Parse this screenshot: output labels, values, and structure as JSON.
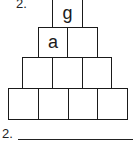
{
  "problem_number_top": "2.",
  "pyramid": {
    "rows": [
      [
        "g"
      ],
      [
        "a",
        ""
      ],
      [
        "",
        "",
        ""
      ],
      [
        "",
        "",
        "",
        ""
      ]
    ]
  },
  "answer": {
    "label": "2.",
    "value": ""
  }
}
